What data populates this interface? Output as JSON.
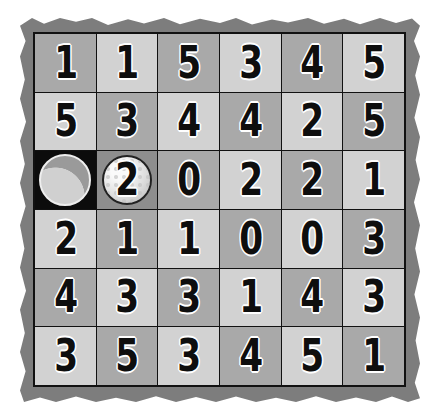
{
  "game": {
    "type": "number-grid-golf-puzzle",
    "rows": 6,
    "cols": 6,
    "colors": {
      "frame": "#7d7d7d",
      "cell_dark": "#a9a9a9",
      "cell_light": "#d2d2d2",
      "hole_cell": "#0c0c0c",
      "ball_cell": "#8e8e8e",
      "digit": "#0e0e0e"
    },
    "grid": [
      [
        "1",
        "1",
        "5",
        "3",
        "4",
        "5"
      ],
      [
        "5",
        "3",
        "4",
        "4",
        "2",
        "5"
      ],
      [
        "",
        "2",
        "0",
        "2",
        "2",
        "1"
      ],
      [
        "2",
        "1",
        "1",
        "0",
        "0",
        "3"
      ],
      [
        "4",
        "3",
        "3",
        "1",
        "4",
        "3"
      ],
      [
        "3",
        "5",
        "3",
        "4",
        "5",
        "1"
      ]
    ],
    "hole": {
      "row": 2,
      "col": 0,
      "icon": "golf-hole-icon"
    },
    "ball": {
      "row": 2,
      "col": 1,
      "value": "2",
      "icon": "golf-ball-icon"
    }
  }
}
